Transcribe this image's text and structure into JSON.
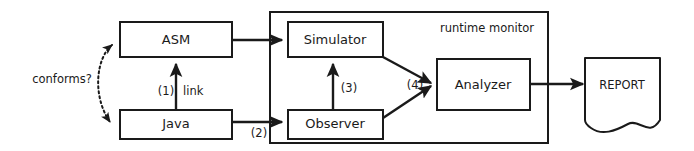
{
  "diagram": {
    "colors": {
      "stroke": "#1a1a1a",
      "fill": "#ffffff",
      "background": "#ffffff"
    },
    "containers": [
      {
        "id": "runtime-monitor",
        "label": "runtime monitor"
      }
    ],
    "nodes": [
      {
        "id": "asm",
        "label": "ASM",
        "shape": "rectangle"
      },
      {
        "id": "java",
        "label": "Java",
        "shape": "rectangle"
      },
      {
        "id": "simulator",
        "label": "Simulator",
        "shape": "rectangle"
      },
      {
        "id": "observer",
        "label": "Observer",
        "shape": "rectangle"
      },
      {
        "id": "analyzer",
        "label": "Analyzer",
        "shape": "rectangle"
      },
      {
        "id": "report",
        "label": "REPORT",
        "shape": "document"
      }
    ],
    "edges": [
      {
        "id": "conforms",
        "label": "conforms?",
        "from": "java",
        "to": "asm",
        "style": "dotted",
        "arrow": "double"
      },
      {
        "id": "link",
        "label_number": "(1)",
        "label_text": "link",
        "from": "java",
        "to": "asm",
        "style": "solid",
        "arrow": "single"
      },
      {
        "id": "asm-simulator",
        "label": "",
        "from": "asm",
        "to": "simulator",
        "style": "solid",
        "arrow": "single"
      },
      {
        "id": "java-observer",
        "label_number": "(2)",
        "from": "java",
        "to": "observer",
        "style": "solid",
        "arrow": "single"
      },
      {
        "id": "observer-simulator",
        "label_number": "(3)",
        "from": "observer",
        "to": "simulator",
        "style": "solid",
        "arrow": "single"
      },
      {
        "id": "to-analyzer",
        "label_number": "(4)",
        "from": "simulator and observer",
        "to": "analyzer",
        "style": "solid",
        "arrow": "single"
      },
      {
        "id": "analyzer-report",
        "label": "",
        "from": "analyzer",
        "to": "report",
        "style": "solid",
        "arrow": "single"
      }
    ],
    "labels": {
      "conforms": "conforms?",
      "step1": "(1)",
      "link": "link",
      "step2": "(2)",
      "step3": "(3)",
      "step4": "(4)",
      "runtime_monitor": "runtime monitor",
      "asm": "ASM",
      "java": "Java",
      "simulator": "Simulator",
      "observer": "Observer",
      "analyzer": "Analyzer",
      "report": "REPORT"
    }
  }
}
